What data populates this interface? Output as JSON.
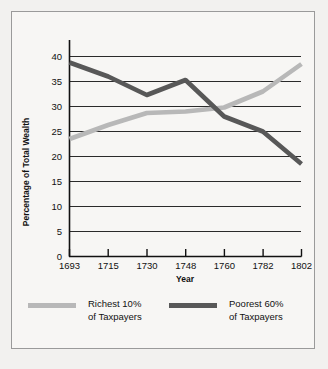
{
  "chart_data": {
    "type": "line",
    "title": "",
    "xlabel": "Year",
    "ylabel": "Percentage of Total Wealth",
    "x": [
      1693,
      1715,
      1730,
      1748,
      1760,
      1782,
      1802
    ],
    "xtick_labels": [
      "1693",
      "1715",
      "1730",
      "1748",
      "1760",
      "1782",
      "1802"
    ],
    "ytick_labels": [
      "0",
      "5",
      "10",
      "15",
      "20",
      "25",
      "30",
      "35",
      "40"
    ],
    "yticks": [
      0,
      5,
      10,
      15,
      20,
      25,
      30,
      35,
      40
    ],
    "ylim": [
      0,
      40
    ],
    "grid": "horizontal",
    "legend_position": "below",
    "series": [
      {
        "name": "Richest 10% of Taxpayers",
        "legend_line1": "Richest 10%",
        "legend_line2": "of Taxpayers",
        "color": "#b8b8b8",
        "values": [
          23.5,
          26.3,
          28.7,
          29.0,
          29.8,
          33.0,
          38.5
        ]
      },
      {
        "name": "Poorest 60% of Taxpayers",
        "legend_line1": "Poorest 60%",
        "legend_line2": "of Taxpayers",
        "color": "#585858",
        "values": [
          38.8,
          36.0,
          32.3,
          35.3,
          28.0,
          25.0,
          18.5
        ]
      }
    ]
  },
  "colors": {
    "background": "#f2f1ef",
    "panel": "#f7f6f4",
    "border": "#9a9a9a",
    "axis": "#111111",
    "gridline": "#2a2a2a"
  }
}
